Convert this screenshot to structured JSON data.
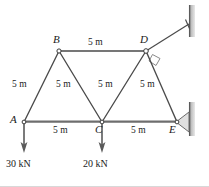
{
  "figure": {
    "type": "truss-diagram",
    "colors": {
      "member": "#4a4a4a",
      "bottom_chord": "#6e6e6e",
      "wall": "#7a7a7a",
      "text": "#1a1a1a",
      "background": "#ffffff"
    },
    "joints": [
      {
        "id": "A",
        "label": "A",
        "x": 24,
        "y": 122,
        "label_x": 10,
        "label_y": 116
      },
      {
        "id": "B",
        "label": "B",
        "x": 59,
        "y": 51,
        "label_x": 53,
        "label_y": 36
      },
      {
        "id": "C",
        "label": "C",
        "x": 102,
        "y": 122,
        "label_x": 96,
        "label_y": 126
      },
      {
        "id": "D",
        "label": "D",
        "x": 146,
        "y": 51,
        "label_x": 141,
        "label_y": 36
      },
      {
        "id": "E",
        "label": "E",
        "x": 177,
        "y": 122,
        "label_x": 169,
        "label_y": 126
      }
    ],
    "members": [
      {
        "from": "A",
        "to": "B",
        "length_label": "5 m"
      },
      {
        "from": "B",
        "to": "C",
        "length_label": "5 m"
      },
      {
        "from": "C",
        "to": "D",
        "length_label": "5 m"
      },
      {
        "from": "D",
        "to": "E",
        "length_label": "5 m"
      },
      {
        "from": "B",
        "to": "D",
        "length_label": "5 m"
      },
      {
        "from": "A",
        "to": "C",
        "length_label": "5 m"
      },
      {
        "from": "C",
        "to": "E",
        "length_label": "5 m"
      }
    ],
    "dimension_labels": [
      {
        "name": "label-bd-top",
        "text": "5 m",
        "x": 88,
        "y": 40
      },
      {
        "name": "label-ab-left",
        "text": "5 m",
        "x": 12,
        "y": 80
      },
      {
        "name": "label-bc-diagonal",
        "text": "5 m",
        "x": 56,
        "y": 80
      },
      {
        "name": "label-cd-diagonal",
        "text": "5 m",
        "x": 97,
        "y": 80
      },
      {
        "name": "label-de-diagonal",
        "text": "5 m",
        "x": 139,
        "y": 80
      },
      {
        "name": "label-ac-bottom",
        "text": "5 m",
        "x": 52,
        "y": 127
      },
      {
        "name": "label-ce-bottom",
        "text": "5 m",
        "x": 130,
        "y": 127
      }
    ],
    "loads": [
      {
        "name": "load-at-a",
        "joint": "A",
        "text": "30 kN",
        "x": 24,
        "y_start": 123,
        "y_end": 152,
        "label_x": 7,
        "label_y": 160
      },
      {
        "name": "load-at-c",
        "joint": "C",
        "text": "20 kN",
        "x": 102,
        "y_start": 123,
        "y_end": 152,
        "label_x": 84,
        "label_y": 160
      }
    ],
    "supports": [
      {
        "name": "wall-upper",
        "type": "wall",
        "x": 192,
        "y_start": 5,
        "y_end": 37
      },
      {
        "name": "wall-lower",
        "type": "wall",
        "x": 192,
        "y_start": 102,
        "y_end": 136
      },
      {
        "name": "support-link-d",
        "type": "two-force-link",
        "from_joint": "D",
        "anchor_x": 190,
        "anchor_y": 24,
        "right_angle_marker": true
      },
      {
        "name": "support-pin-e",
        "type": "pin",
        "joint": "E",
        "anchor_x": 191,
        "anchor_y": 122
      }
    ]
  }
}
